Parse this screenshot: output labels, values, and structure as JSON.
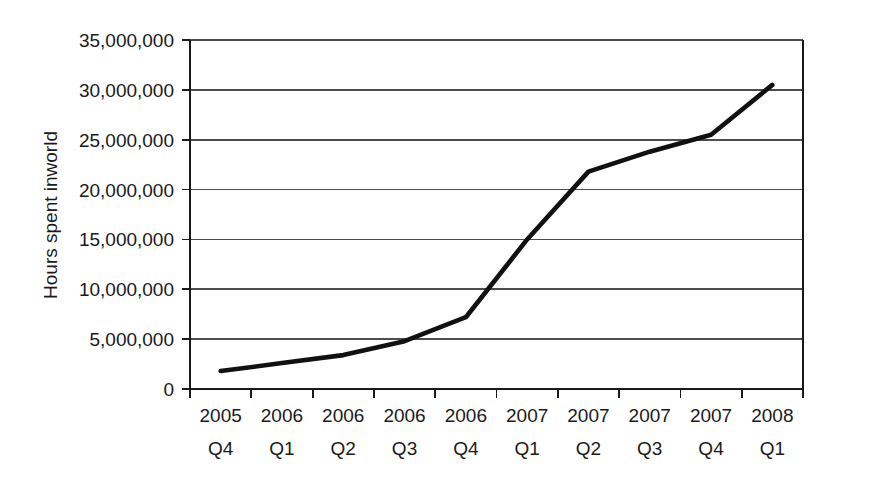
{
  "chart_data": {
    "type": "line",
    "title": "",
    "subtitle": "",
    "xlabel": "",
    "ylabel": "Hours spent inworld",
    "categories": [
      "2005 Q4",
      "2006 Q1",
      "2006 Q2",
      "2006 Q3",
      "2006 Q4",
      "2007 Q1",
      "2007 Q2",
      "2007 Q3",
      "2007 Q4",
      "2008 Q1"
    ],
    "category_years": [
      "2005",
      "2006",
      "2006",
      "2006",
      "2006",
      "2007",
      "2007",
      "2007",
      "2007",
      "2008"
    ],
    "category_quarters": [
      "Q4",
      "Q1",
      "Q2",
      "Q3",
      "Q4",
      "Q1",
      "Q2",
      "Q3",
      "Q4",
      "Q1"
    ],
    "values": [
      1800000,
      2600000,
      3400000,
      4800000,
      7200000,
      15000000,
      21800000,
      23800000,
      25500000,
      30500000
    ],
    "ylim": [
      0,
      35000000
    ],
    "ytick_values": [
      0,
      5000000,
      10000000,
      15000000,
      20000000,
      25000000,
      30000000,
      35000000
    ],
    "ytick_labels": [
      "0",
      "5,000,000",
      "10,000,000",
      "15,000,000",
      "20,000,000",
      "25,000,000",
      "30,000,000",
      "35,000,000"
    ],
    "grid": true,
    "grid_axis": "y",
    "legend": false,
    "legend_position": "none",
    "series": [
      {
        "name": "Hours spent inworld",
        "color": "#111111",
        "values": [
          1800000,
          2600000,
          3400000,
          4800000,
          7200000,
          15000000,
          21800000,
          23800000,
          25500000,
          30500000
        ]
      }
    ]
  },
  "colors": {
    "line": "#111111",
    "grid": "#4d4d4d",
    "axis": "#1a1a1a",
    "background": "#ffffff",
    "text": "#1a1a1a"
  },
  "axis": {
    "y_title": "Hours spent inworld"
  }
}
